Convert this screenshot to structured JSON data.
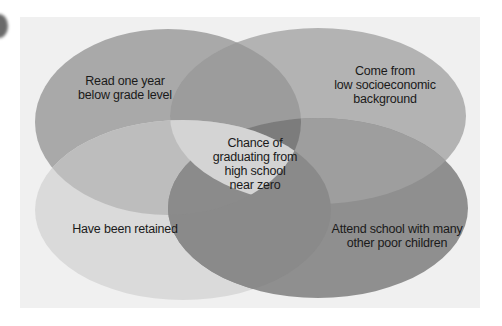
{
  "diagram": {
    "type": "venn",
    "sets": [
      {
        "label_line1": "Read one year",
        "label_line2": "below grade level",
        "color": "#a9a9a9"
      },
      {
        "label_line1": "Come from",
        "label_line2": "low socioeconomic",
        "label_line3": "background",
        "color": "#b3b3b3"
      },
      {
        "label_line1": "Have been retained",
        "color": "#dadada"
      },
      {
        "label_line1": "Attend school with many",
        "label_line2": "other poor children",
        "color": "#8e8e8e"
      }
    ],
    "center": {
      "line1": "Chance of",
      "line2": "graduating from",
      "line3": "high school",
      "line4": "near zero",
      "color": "#d4d4d4"
    },
    "panel_color": "#f0f0f0"
  }
}
